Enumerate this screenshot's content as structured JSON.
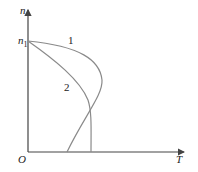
{
  "diagram": {
    "y_axis_label": "n",
    "x_axis_label": "T",
    "origin_label": "O",
    "y_tick_label": "n",
    "y_tick_sub": "1",
    "curves": [
      {
        "label": "1",
        "description": "starts at n1, bulges right then bends back to intersect T-axis at smaller T"
      },
      {
        "label": "2",
        "description": "starts at n1, decreases to near-vertical meeting T-axis at larger T"
      }
    ],
    "colors": {
      "axis": "#444444",
      "curve": "#8a8a8a",
      "text": "#222222"
    }
  }
}
